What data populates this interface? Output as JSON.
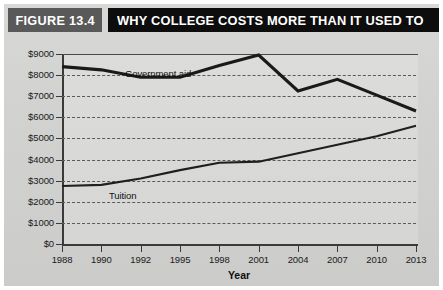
{
  "figure": {
    "number_label": "FIGURE 13.4",
    "title": "WHY COLLEGE COSTS MORE THAN IT USED TO"
  },
  "colors": {
    "figure_number_bg": "#595959",
    "title_bg": "#0d0d0d",
    "title_text": "#ffffff",
    "panel_bg": "#d4d4d2",
    "line": "#1a1a1a",
    "axis": "#3a3a3a",
    "grid": "#5a5a5a"
  },
  "chart_data": {
    "type": "line",
    "title": "WHY COLLEGE COSTS MORE THAN IT USED TO",
    "xlabel": "Year",
    "ylabel": "",
    "categories": [
      "1988",
      "1990",
      "1992",
      "1995",
      "1998",
      "2001",
      "2004",
      "2007",
      "2010",
      "2013"
    ],
    "ytick_labels": [
      "$0",
      "$1000",
      "$2000",
      "$3000",
      "$4000",
      "$5000",
      "$6000",
      "$7000",
      "$8000",
      "$9000"
    ],
    "ytick_values": [
      0,
      1000,
      2000,
      3000,
      4000,
      5000,
      6000,
      7000,
      8000,
      9000
    ],
    "ylim": [
      0,
      9000
    ],
    "grid": "horizontal-dashed",
    "legend": "inline-labels",
    "series": [
      {
        "name": "Government aid",
        "label": "Government aid",
        "values": [
          8400,
          8250,
          7900,
          7900,
          8450,
          8950,
          7250,
          7800,
          7050,
          6300
        ]
      },
      {
        "name": "Tuition",
        "label": "Tuition",
        "values": [
          2750,
          2800,
          3100,
          3500,
          3850,
          3900,
          4300,
          4700,
          5100,
          5600
        ]
      }
    ]
  }
}
